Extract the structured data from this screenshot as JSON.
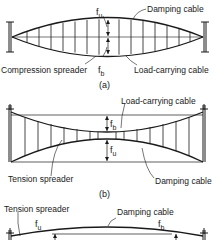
{
  "figure_a": {
    "caption": "(a)",
    "labels": {
      "damping_cable": "Damping cable",
      "compression_spreader": "Compression spreader",
      "load_carrying_cable": "Load-carrying cable"
    },
    "symbols": {
      "fu": "f",
      "fu_sub": "u",
      "fb": "f",
      "fb_sub": "b"
    }
  },
  "figure_b": {
    "caption": "(b)",
    "labels": {
      "load_carrying_cable": "Load-carrying cable",
      "tension_spreader": "Tension spreader",
      "damping_cable": "Damping cable"
    },
    "symbols": {
      "fb": "f",
      "fb_sub": "b",
      "fu": "f",
      "fu_sub": "u"
    }
  },
  "figure_c": {
    "labels": {
      "tension_spreader": "Tension spreader",
      "damping_cable": "Damping cable"
    },
    "symbols": {
      "fu": "f",
      "fu_sub": "u",
      "fb": "f",
      "fb_sub": "b"
    }
  },
  "colors": {
    "line": "#1a1a1a",
    "background": "#ffffff"
  }
}
